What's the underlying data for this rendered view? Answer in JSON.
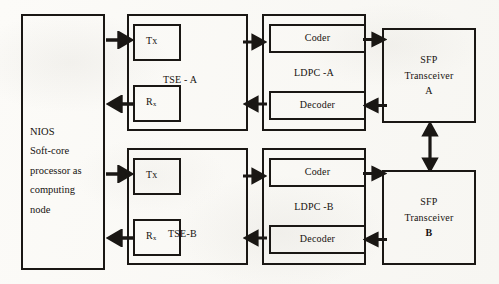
{
  "diagram": {
    "background_color": "#fbfaf7",
    "line_color": "#1a1714",
    "blocks": {
      "nios": {
        "lines": [
          "NIOS",
          "Soft-core",
          "processor as",
          "computing",
          "node"
        ]
      },
      "tse_a": {
        "label": "TSE - A"
      },
      "tse_b": {
        "label": "TSE-B"
      },
      "tx_a": {
        "label": "Tx"
      },
      "rx_a": {
        "label_main": "R",
        "label_sub": "x"
      },
      "tx_b": {
        "label": "Tx"
      },
      "rx_b": {
        "label_main": "R",
        "label_sub": "x"
      },
      "ldpc_a": {
        "label": "LDPC -A"
      },
      "ldpc_b": {
        "label": "LDPC -B"
      },
      "coder_a": {
        "label": "Coder"
      },
      "decoder_a": {
        "label": "Decoder"
      },
      "coder_b": {
        "label": "Coder"
      },
      "decoder_b": {
        "label": "Decoder"
      },
      "sfp_a": {
        "line1": "SFP",
        "line2": "Transceiver",
        "line3": "A"
      },
      "sfp_b": {
        "line1": "SFP",
        "line2": "Transceiver",
        "line3": "B"
      }
    },
    "connectors": [
      {
        "name": "nios-to-tx-a",
        "direction": "right"
      },
      {
        "name": "rx-a-to-nios",
        "direction": "left"
      },
      {
        "name": "nios-to-tx-b",
        "direction": "right"
      },
      {
        "name": "rx-b-to-nios",
        "direction": "left"
      },
      {
        "name": "tse-a-to-ldpc-a",
        "direction": "right"
      },
      {
        "name": "ldpc-a-to-tse-a",
        "direction": "left"
      },
      {
        "name": "tse-b-to-ldpc-b",
        "direction": "right"
      },
      {
        "name": "ldpc-b-to-tse-b",
        "direction": "left"
      },
      {
        "name": "coder-a-to-sfp-a",
        "direction": "right"
      },
      {
        "name": "sfp-a-to-decoder-a",
        "direction": "left"
      },
      {
        "name": "coder-b-to-sfp-b",
        "direction": "right"
      },
      {
        "name": "sfp-b-to-decoder-b",
        "direction": "left"
      },
      {
        "name": "sfp-a-sfp-b-fiber-link",
        "direction": "bidirectional-vertical"
      }
    ]
  }
}
